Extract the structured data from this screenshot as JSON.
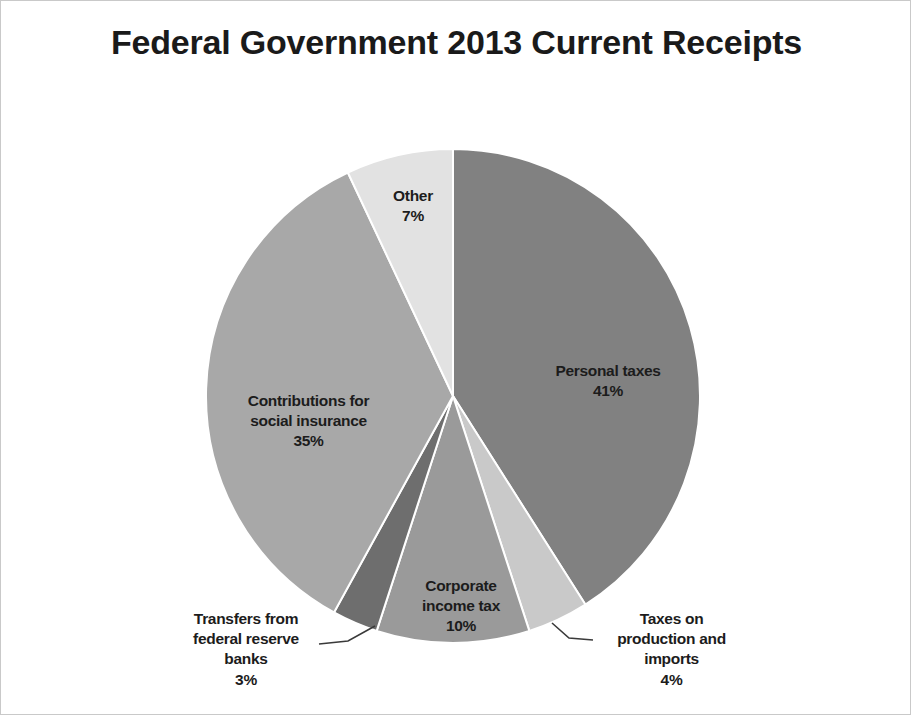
{
  "chart_data": {
    "type": "pie",
    "title": "Federal Government 2013 Current Receipts",
    "xlabel": "",
    "ylabel": "",
    "legend_position": "none",
    "grid": false,
    "start_angle_deg": 0,
    "direction": "clockwise",
    "categories": [
      "Personal taxes",
      "Taxes on production and imports",
      "Corporate income tax",
      "Transfers from federal reserve banks",
      "Contributions for social insurance",
      "Other"
    ],
    "values": [
      41,
      4,
      10,
      3,
      35,
      7
    ],
    "value_suffix": "%",
    "colors": [
      "#818181",
      "#c9c9c9",
      "#9a9a9a",
      "#6e6e6e",
      "#a8a8a8",
      "#e2e2e2"
    ],
    "slices": [
      {
        "label": "Personal taxes",
        "percent": 41,
        "percent_text": "41%",
        "color": "#818181",
        "label_placement": "inside"
      },
      {
        "label": "Taxes on production and imports",
        "percent": 4,
        "percent_text": "4%",
        "color": "#c9c9c9",
        "label_placement": "outside-leader"
      },
      {
        "label": "Corporate income tax",
        "percent": 10,
        "percent_text": "10%",
        "color": "#9a9a9a",
        "label_placement": "inside"
      },
      {
        "label": "Transfers from federal reserve banks",
        "percent": 3,
        "percent_text": "3%",
        "color": "#6e6e6e",
        "label_placement": "outside-leader"
      },
      {
        "label": "Contributions for social insurance",
        "percent": 35,
        "percent_text": "35%",
        "color": "#a8a8a8",
        "label_placement": "inside"
      },
      {
        "label": "Other",
        "percent": 7,
        "percent_text": "7%",
        "color": "#e2e2e2",
        "label_placement": "inside"
      }
    ]
  },
  "labels": {
    "personal_taxes": {
      "name": "Personal taxes",
      "percent": "41%"
    },
    "taxes_production_imports": {
      "name": "Taxes on\nproduction and\nimports",
      "percent": "4%"
    },
    "corporate_income_tax": {
      "name": "Corporate\nincome tax",
      "percent": "10%"
    },
    "transfers_federal_reserve": {
      "name": "Transfers from\nfederal reserve\nbanks",
      "percent": "3%"
    },
    "contributions_social_insurance": {
      "name": "Contributions for\nsocial insurance",
      "percent": "35%"
    },
    "other": {
      "name": "Other",
      "percent": "7%"
    }
  },
  "colors": {
    "background": "#ffffff",
    "border": "#c9c9c9",
    "text": "#1c1c1c",
    "title": "#1a1a1a",
    "leader_line": "#3a3a3a"
  }
}
